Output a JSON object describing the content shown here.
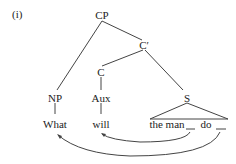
{
  "example_label": "(i)",
  "nodes": {
    "cp": "CP",
    "c_bar": "C′",
    "c": "C",
    "np": "NP",
    "aux": "Aux",
    "s": "S"
  },
  "leaves": {
    "what": "What",
    "will": "will",
    "the_man": "the man",
    "do": "do"
  },
  "movement_arrows": [
    {
      "from": "gap-after-the-man",
      "to": "will"
    },
    {
      "from": "gap-after-do",
      "to": "What"
    }
  ]
}
